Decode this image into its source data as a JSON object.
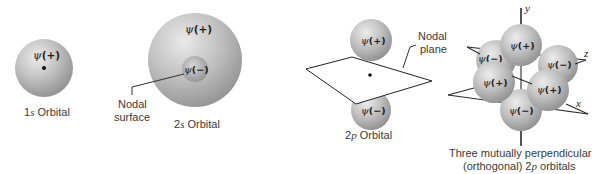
{
  "figure": {
    "panels": [
      {
        "id": "1s",
        "caption": "1s Orbital",
        "caption_prefix": "1",
        "caption_italic": "s",
        "caption_suffix": " Orbital",
        "lobes": [
          {
            "label": "ψ(+)",
            "psi": "ψ",
            "sign": "(+)"
          }
        ],
        "nucleus": true
      },
      {
        "id": "2s",
        "caption": "2s Orbital",
        "caption_prefix": "2",
        "caption_italic": "s",
        "caption_suffix": " Orbital",
        "lobes": [
          {
            "label": "ψ(+)",
            "psi": "ψ",
            "sign": "(+)"
          },
          {
            "label": "ψ(−)",
            "psi": "ψ",
            "sign": "(−)"
          }
        ],
        "callout": {
          "line1": "Nodal",
          "line2": "surface"
        }
      },
      {
        "id": "2p",
        "caption": "2p Orbital",
        "caption_prefix": "2",
        "caption_italic": "p",
        "caption_suffix": " Orbital",
        "lobes": [
          {
            "label": "ψ(+)",
            "psi": "ψ",
            "sign": "(+)"
          },
          {
            "label": "ψ(−)",
            "psi": "ψ",
            "sign": "(−)"
          }
        ],
        "nucleus": true,
        "callout": {
          "line1": "Nodal",
          "line2": "plane"
        }
      },
      {
        "id": "2p-orthogonal",
        "caption_line1": "Three mutually perpendicular",
        "caption_line2_prefix": "(orthogonal) 2",
        "caption_line2_italic": "p",
        "caption_line2_suffix": " orbitals",
        "axes": {
          "y": "y",
          "z": "z",
          "x": "x"
        },
        "lobes": [
          {
            "position": "top",
            "psi": "ψ",
            "sign": "(+)"
          },
          {
            "position": "left-back",
            "psi": "ψ",
            "sign": "(−)"
          },
          {
            "position": "right-back",
            "psi": "ψ",
            "sign": "(−)"
          },
          {
            "position": "left-front",
            "psi": "ψ",
            "sign": "(+)"
          },
          {
            "position": "right-front",
            "psi": "ψ",
            "sign": "(+)"
          },
          {
            "position": "bottom",
            "psi": "ψ",
            "sign": "(−)"
          }
        ]
      }
    ],
    "colors": {
      "sphere_light": "#e6e6e6",
      "sphere_mid": "#b5b5b5",
      "sphere_dark": "#8a8a8a",
      "text": "#333333",
      "line": "#333333"
    }
  }
}
